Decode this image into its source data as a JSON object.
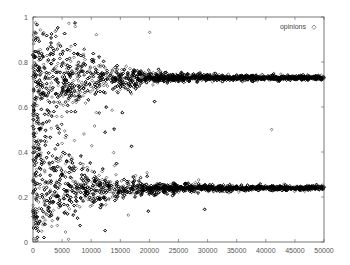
{
  "chart_data": {
    "type": "scatter",
    "title": "",
    "xlabel": "",
    "ylabel": "",
    "xlim": [
      0,
      50000
    ],
    "ylim": [
      0,
      1
    ],
    "grid": false,
    "legend_position": "top-right",
    "x_ticks": [
      "0",
      "5000",
      "10000",
      "15000",
      "20000",
      "25000",
      "30000",
      "35000",
      "40000",
      "45000",
      "50000"
    ],
    "y_ticks": [
      "0",
      "0.2",
      "0.4",
      "0.6",
      "0.8",
      "1"
    ],
    "series": [
      {
        "name": "opinions",
        "marker": "open-diamond",
        "color": "#000000",
        "description": "Opinion values start uniformly spread in [0,1] and converge over time into two clusters",
        "clusters": [
          {
            "label": "upper",
            "converged_value": 0.73,
            "initial_spread": [
              0.4,
              0.97
            ],
            "converged_by_x": 30000
          },
          {
            "label": "lower",
            "converged_value": 0.24,
            "initial_spread": [
              0.02,
              0.55
            ],
            "converged_by_x": 30000
          }
        ],
        "outliers": [
          {
            "x": 41000,
            "y": 0.5
          }
        ]
      }
    ]
  },
  "legend": {
    "label": "opinions",
    "marker": "◇"
  }
}
